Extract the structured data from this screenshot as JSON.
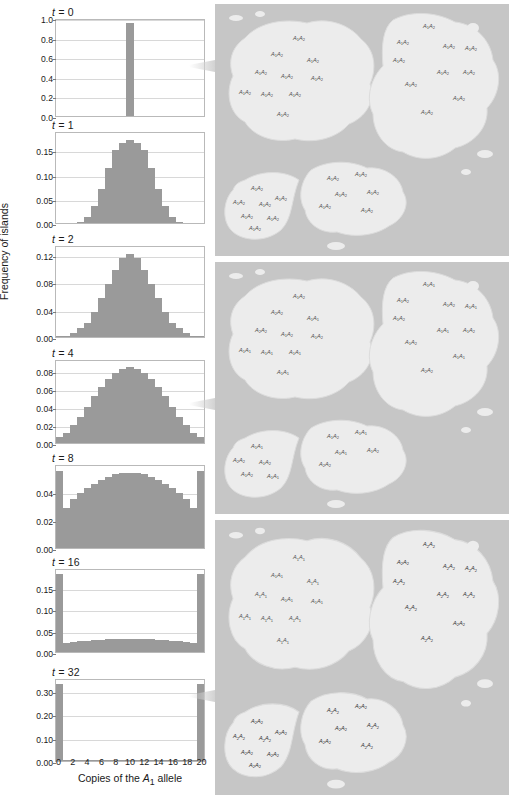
{
  "figure": {
    "y_axis_label": "Frequency of islands",
    "x_axis_label_prefix": "Copies of the ",
    "x_axis_label_allele": "A",
    "x_axis_label_allele_sub": "1",
    "x_axis_label_suffix": " allele",
    "bar_color": "#9a9a9a",
    "sea_color": "#c6c6c6",
    "land_color": "#ececec",
    "xticks": [
      0,
      2,
      4,
      6,
      8,
      10,
      12,
      14,
      16,
      18,
      20
    ]
  },
  "chart_data": [
    {
      "type": "bar",
      "title": "t = 0",
      "t": 0,
      "xlabel": "Copies of the A1 allele",
      "ylabel": "Frequency of islands",
      "categories": [
        0,
        1,
        2,
        3,
        4,
        5,
        6,
        7,
        8,
        9,
        10,
        11,
        12,
        13,
        14,
        15,
        16,
        17,
        18,
        19,
        20
      ],
      "values": [
        0,
        0,
        0,
        0,
        0,
        0,
        0,
        0,
        0,
        0,
        0.97,
        0,
        0,
        0,
        0,
        0,
        0,
        0,
        0,
        0,
        0
      ],
      "ylim": [
        0,
        1.0
      ],
      "yticks": [
        0.0,
        0.2,
        0.4,
        0.6,
        0.8,
        1.0
      ],
      "yticklabels": [
        "0.0",
        "0.2",
        "0.4",
        "0.6",
        "0.8",
        "1.0"
      ],
      "grid": true
    },
    {
      "type": "bar",
      "title": "t = 1",
      "t": 1,
      "categories": [
        0,
        1,
        2,
        3,
        4,
        5,
        6,
        7,
        8,
        9,
        10,
        11,
        12,
        13,
        14,
        15,
        16,
        17,
        18,
        19,
        20
      ],
      "values": [
        0,
        0,
        0,
        0.002,
        0.012,
        0.035,
        0.071,
        0.116,
        0.155,
        0.169,
        0.176,
        0.169,
        0.155,
        0.116,
        0.071,
        0.035,
        0.012,
        0.002,
        0,
        0,
        0
      ],
      "ylim": [
        0,
        0.19
      ],
      "yticks": [
        0.0,
        0.05,
        0.1,
        0.15
      ],
      "yticklabels": [
        "0.00",
        "0.05",
        "0.10",
        "0.15"
      ],
      "grid": true
    },
    {
      "type": "bar",
      "title": "t = 2",
      "t": 2,
      "categories": [
        0,
        1,
        2,
        3,
        4,
        5,
        6,
        7,
        8,
        9,
        10,
        11,
        12,
        13,
        14,
        15,
        16,
        17,
        18,
        19,
        20
      ],
      "values": [
        0.001,
        0.002,
        0.006,
        0.013,
        0.021,
        0.038,
        0.058,
        0.08,
        0.101,
        0.118,
        0.124,
        0.118,
        0.101,
        0.08,
        0.058,
        0.038,
        0.021,
        0.013,
        0.006,
        0.002,
        0.001
      ],
      "ylim": [
        0,
        0.135
      ],
      "yticks": [
        0.0,
        0.04,
        0.08,
        0.12
      ],
      "yticklabels": [
        "0.00",
        "0.04",
        "0.08",
        "0.12"
      ],
      "grid": true
    },
    {
      "type": "bar",
      "title": "t = 4",
      "t": 4,
      "categories": [
        0,
        1,
        2,
        3,
        4,
        5,
        6,
        7,
        8,
        9,
        10,
        11,
        12,
        13,
        14,
        15,
        16,
        17,
        18,
        19,
        20
      ],
      "values": [
        0.007,
        0.011,
        0.02,
        0.03,
        0.041,
        0.053,
        0.063,
        0.073,
        0.079,
        0.084,
        0.086,
        0.084,
        0.079,
        0.073,
        0.063,
        0.053,
        0.041,
        0.03,
        0.02,
        0.011,
        0.007
      ],
      "ylim": [
        0,
        0.093
      ],
      "yticks": [
        0.0,
        0.02,
        0.04,
        0.06,
        0.08
      ],
      "yticklabels": [
        "0.00",
        "0.02",
        "0.04",
        "0.06",
        "0.08"
      ],
      "grid": true
    },
    {
      "type": "bar",
      "title": "t = 8",
      "t": 8,
      "categories": [
        0,
        1,
        2,
        3,
        4,
        5,
        6,
        7,
        8,
        9,
        10,
        11,
        12,
        13,
        14,
        15,
        16,
        17,
        18,
        19,
        20
      ],
      "values": [
        0.056,
        0.029,
        0.036,
        0.04,
        0.044,
        0.047,
        0.05,
        0.052,
        0.054,
        0.055,
        0.055,
        0.055,
        0.054,
        0.052,
        0.05,
        0.047,
        0.044,
        0.04,
        0.036,
        0.029,
        0.056
      ],
      "ylim": [
        0,
        0.06
      ],
      "yticks": [
        0.0,
        0.02,
        0.04
      ],
      "yticklabels": [
        "0.00",
        "0.02",
        "0.04"
      ],
      "grid": true
    },
    {
      "type": "bar",
      "title": "t = 16",
      "t": 16,
      "categories": [
        0,
        1,
        2,
        3,
        4,
        5,
        6,
        7,
        8,
        9,
        10,
        11,
        12,
        13,
        14,
        15,
        16,
        17,
        18,
        19,
        20
      ],
      "values": [
        0.186,
        0.021,
        0.024,
        0.026,
        0.027,
        0.028,
        0.029,
        0.03,
        0.03,
        0.031,
        0.031,
        0.031,
        0.03,
        0.03,
        0.029,
        0.028,
        0.027,
        0.026,
        0.024,
        0.021,
        0.186
      ],
      "ylim": [
        0,
        0.196
      ],
      "yticks": [
        0.0,
        0.05,
        0.1,
        0.15
      ],
      "yticklabels": [
        "0.00",
        "0.05",
        "0.10",
        "0.15"
      ],
      "grid": true
    },
    {
      "type": "bar",
      "title": "t = 32",
      "t": 32,
      "categories": [
        0,
        1,
        2,
        3,
        4,
        5,
        6,
        7,
        8,
        9,
        10,
        11,
        12,
        13,
        14,
        15,
        16,
        17,
        18,
        19,
        20
      ],
      "values": [
        0.338,
        0.004,
        0.004,
        0.005,
        0.005,
        0.005,
        0.006,
        0.006,
        0.006,
        0.006,
        0.006,
        0.006,
        0.006,
        0.006,
        0.006,
        0.005,
        0.005,
        0.005,
        0.004,
        0.004,
        0.338
      ],
      "ylim": [
        0,
        0.355
      ],
      "yticks": [
        0.0,
        0.1,
        0.2,
        0.3
      ],
      "yticklabels": [
        "0.00",
        "0.10",
        "0.20",
        "0.30"
      ],
      "grid": true
    }
  ],
  "island_panels": [
    {
      "caption": "t = 0 populations: every island all heterozygous",
      "islands": [
        {
          "genotypes": [
            "A1A2",
            "A1A2",
            "A1A2",
            "A1A2",
            "A1A2",
            "A1A2",
            "A1A2",
            "A1A2",
            "A1A2",
            "A1A2"
          ]
        },
        {
          "genotypes": [
            "A1A2",
            "A1A2",
            "A1A2",
            "A1A2",
            "A1A2",
            "A1A2",
            "A1A2",
            "A1A2",
            "A1A2",
            "A1A2"
          ]
        },
        {
          "genotypes": [
            "A1A2",
            "A1A2",
            "A1A2",
            "A1A2",
            "A1A2",
            "A1A2"
          ]
        },
        {
          "genotypes": [
            "A1A2",
            "A1A2",
            "A1A2",
            "A1A2",
            "A1A2",
            "A1A2",
            "A1A2"
          ]
        }
      ]
    },
    {
      "caption": "t = 4 populations: mixture of genotypes",
      "islands": [
        {
          "genotypes": [
            "A1A2",
            "A2A2",
            "A1A1",
            "A2A2",
            "A1A2",
            "A1A1",
            "A1A1",
            "A1A1",
            "A1A2",
            "A1A1"
          ]
        },
        {
          "genotypes": [
            "A1A1",
            "A1A2",
            "A1A2",
            "A1A1",
            "A1A2",
            "A1A1",
            "A1A2",
            "A1A2",
            "A1A1",
            "A2A2"
          ]
        },
        {
          "genotypes": [
            "A1A2",
            "A1A1",
            "A1A1",
            "A1A2",
            "A2A2"
          ]
        },
        {
          "genotypes": [
            "A1A1",
            "A2A2",
            "A1A2",
            "A1A2",
            "A1A1"
          ]
        }
      ]
    },
    {
      "caption": "t = 32 populations: islands fixed for one allele",
      "islands": [
        {
          "genotypes": [
            "A1A1",
            "A1A1",
            "A1A1",
            "A1A1",
            "A1A1",
            "A1A1",
            "A1A1",
            "A1A1",
            "A1A1",
            "A1A1"
          ]
        },
        {
          "genotypes": [
            "A2A2",
            "A2A2",
            "A2A2",
            "A2A2",
            "A2A2",
            "A2A2",
            "A2A2",
            "A2A2",
            "A2A2",
            "A2A2"
          ]
        },
        {
          "genotypes": [
            "A2A2",
            "A2A2",
            "A2A2",
            "A2A2",
            "A2A2",
            "A2A2"
          ]
        },
        {
          "genotypes": [
            "A2A2",
            "A2A2",
            "A2A2",
            "A2A2",
            "A2A2",
            "A2A2",
            "A2A2"
          ]
        }
      ]
    }
  ]
}
